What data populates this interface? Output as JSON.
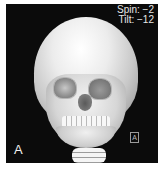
{
  "image": {
    "description": "3D CT volume rendering of a child's skull, frontal view",
    "overlay": {
      "spin_label": "Spin: −2",
      "tilt_label": "Tilt: −12"
    },
    "panel_label": "A",
    "orientation_marker": "A"
  }
}
